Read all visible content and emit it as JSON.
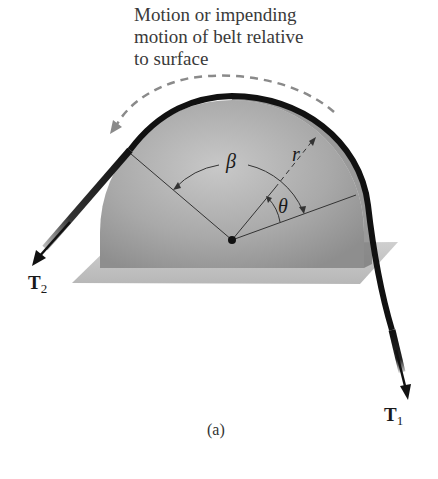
{
  "figure": {
    "annotation": {
      "lines": [
        "Motion or impending",
        "motion of belt relative",
        "to surface"
      ]
    },
    "labels": {
      "tension_2": {
        "symbol": "T",
        "subscript": "2"
      },
      "tension_1": {
        "symbol": "T",
        "subscript": "1"
      },
      "contact_angle": "β",
      "angle": "θ",
      "radius": "r"
    },
    "sub_caption": "(a)",
    "colors": {
      "drum": "#a8a8a8",
      "belt": "#111111",
      "platform": "#c4c4c4",
      "dashed_arrow": "#8a8a8a"
    }
  }
}
